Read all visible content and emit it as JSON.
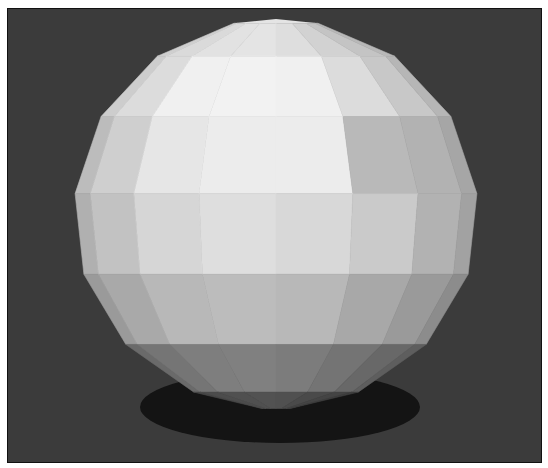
{
  "scene": {
    "subject": "low-poly faceted sphere render",
    "background_color": "#3b3b3b",
    "frame_border_color": "#111111",
    "shadow_color": "#141414",
    "latitude_bands": 7,
    "longitude_segments_visible": 8,
    "facet_shades": [
      [
        "#cfcfcf",
        "#dadada",
        "#e2e2e2",
        "#e4e4e4",
        "#dedede",
        "#d2d2d2",
        "#c4c4c4",
        "#b8b8b8"
      ],
      [
        "#cdcdcd",
        "#dcdcdc",
        "#f0f0f0",
        "#f2f2f2",
        "#f0f0f0",
        "#dcdcdc",
        "#c8c8c8",
        "#b6b6b6"
      ],
      [
        "#bcbcbc",
        "#cfcfcf",
        "#e6e6e6",
        "#ececec",
        "#ececec",
        "#b9b9b9",
        "#b2b2b2",
        "#a6a6a6"
      ],
      [
        "#b0b0b0",
        "#c2c2c2",
        "#d6d6d6",
        "#dedede",
        "#d8d8d8",
        "#cacaca",
        "#b2b2b2",
        "#a2a2a2"
      ],
      [
        "#9a9a9a",
        "#a9a9a9",
        "#b8b8b8",
        "#bcbcbc",
        "#b8b8b8",
        "#a8a8a8",
        "#9a9a9a",
        "#8c8c8c"
      ],
      [
        "#6a6a6a",
        "#757575",
        "#7e7e7e",
        "#808080",
        "#7c7c7c",
        "#747474",
        "#686868",
        "#5e5e5e"
      ],
      [
        "#474747",
        "#4c4c4c",
        "#505050",
        "#525252",
        "#505050",
        "#4a4a4a",
        "#444444",
        "#3e3e3e"
      ]
    ]
  }
}
